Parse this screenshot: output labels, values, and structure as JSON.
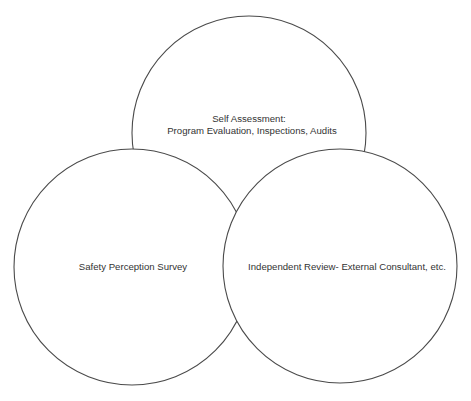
{
  "diagram": {
    "type": "venn",
    "stroke_color": "#4a4a4a",
    "text_color": "#333333",
    "background": "#ffffff",
    "circles": [
      {
        "id": "self-assessment",
        "cx": 249,
        "cy": 133,
        "r": 117,
        "lines": [
          "Self Assessment:",
          "Program Evaluation, Inspections, Audits"
        ]
      },
      {
        "id": "safety-perception-survey",
        "cx": 132,
        "cy": 267,
        "r": 118,
        "lines": [
          "Safety Perception Survey"
        ]
      },
      {
        "id": "independent-review",
        "cx": 340,
        "cy": 266,
        "r": 117,
        "lines": [
          "Independent Review- External Consultant, etc."
        ]
      }
    ]
  }
}
